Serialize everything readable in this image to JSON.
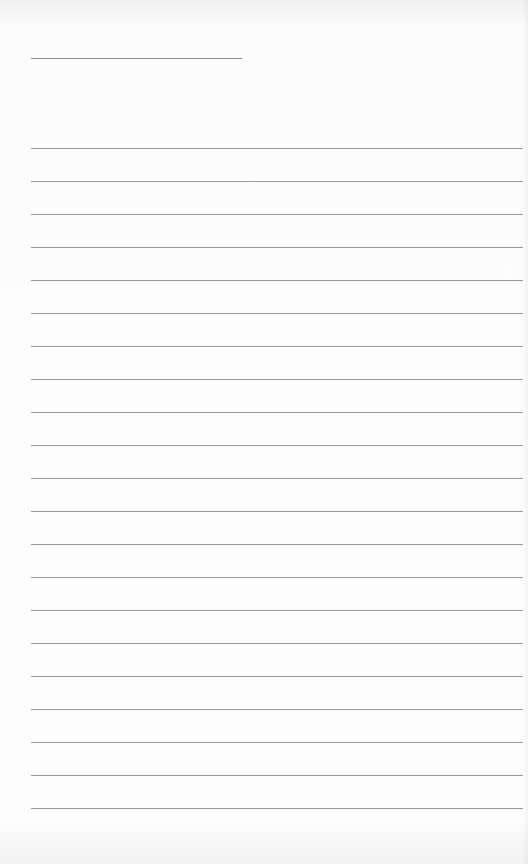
{
  "document": {
    "type": "blank lined sheet",
    "title_line": {
      "left": 31,
      "top": 58,
      "width": 211,
      "text": ""
    },
    "ruled_lines": {
      "count": 21,
      "first_top": 148,
      "spacing": 33,
      "left": 31,
      "width": 492,
      "color": "#9a9a9a"
    },
    "background_color": "#fbfbfb"
  }
}
